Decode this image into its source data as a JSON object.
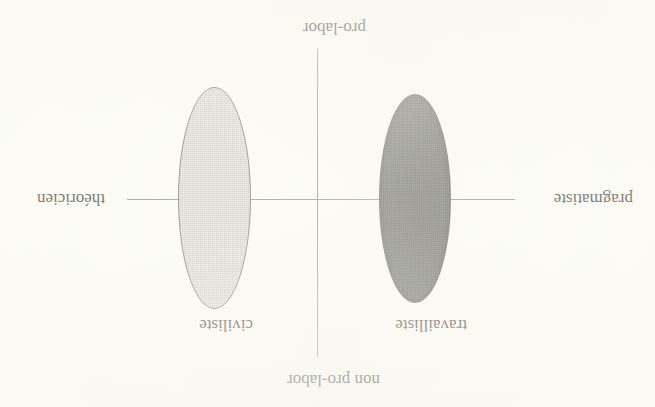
{
  "figure": {
    "orientation": "rotated-180",
    "background_color": "#fffffb",
    "line_color": "#8c8c84",
    "text_color": "#353531"
  },
  "axes": {
    "vertical": {
      "top_label": "non pro-labor",
      "bottom_label": "pro-labor"
    },
    "horizontal": {
      "left_label": "pragmatiste",
      "right_label": "théoricien"
    }
  },
  "groups": [
    {
      "label": "travailliste",
      "fill_color": "#5b5b59",
      "shade": "dark",
      "quadrant": "pragmatiste"
    },
    {
      "label": "civiliste",
      "fill_color": "#d7d7cf",
      "shade": "light",
      "quadrant": "théoricien"
    }
  ],
  "chart_data": {
    "type": "scatter",
    "title": "",
    "xlabel": "",
    "ylabel": "",
    "x_axis_labels": [
      "pragmatiste",
      "théoricien"
    ],
    "y_axis_labels": [
      "pro-labor",
      "non pro-labor"
    ],
    "series": [
      {
        "name": "travailliste",
        "center": [
          -1.0,
          0.0
        ],
        "width": 0.36,
        "height": 1.0,
        "color": "#5b5b59"
      },
      {
        "name": "civiliste",
        "center": [
          1.0,
          0.0
        ],
        "width": 0.37,
        "height": 1.07,
        "color": "#d7d7cf"
      }
    ],
    "xlim": [
      -2,
      2
    ],
    "ylim": [
      -1.6,
      1.6
    ],
    "grid": false,
    "legend": "none"
  }
}
